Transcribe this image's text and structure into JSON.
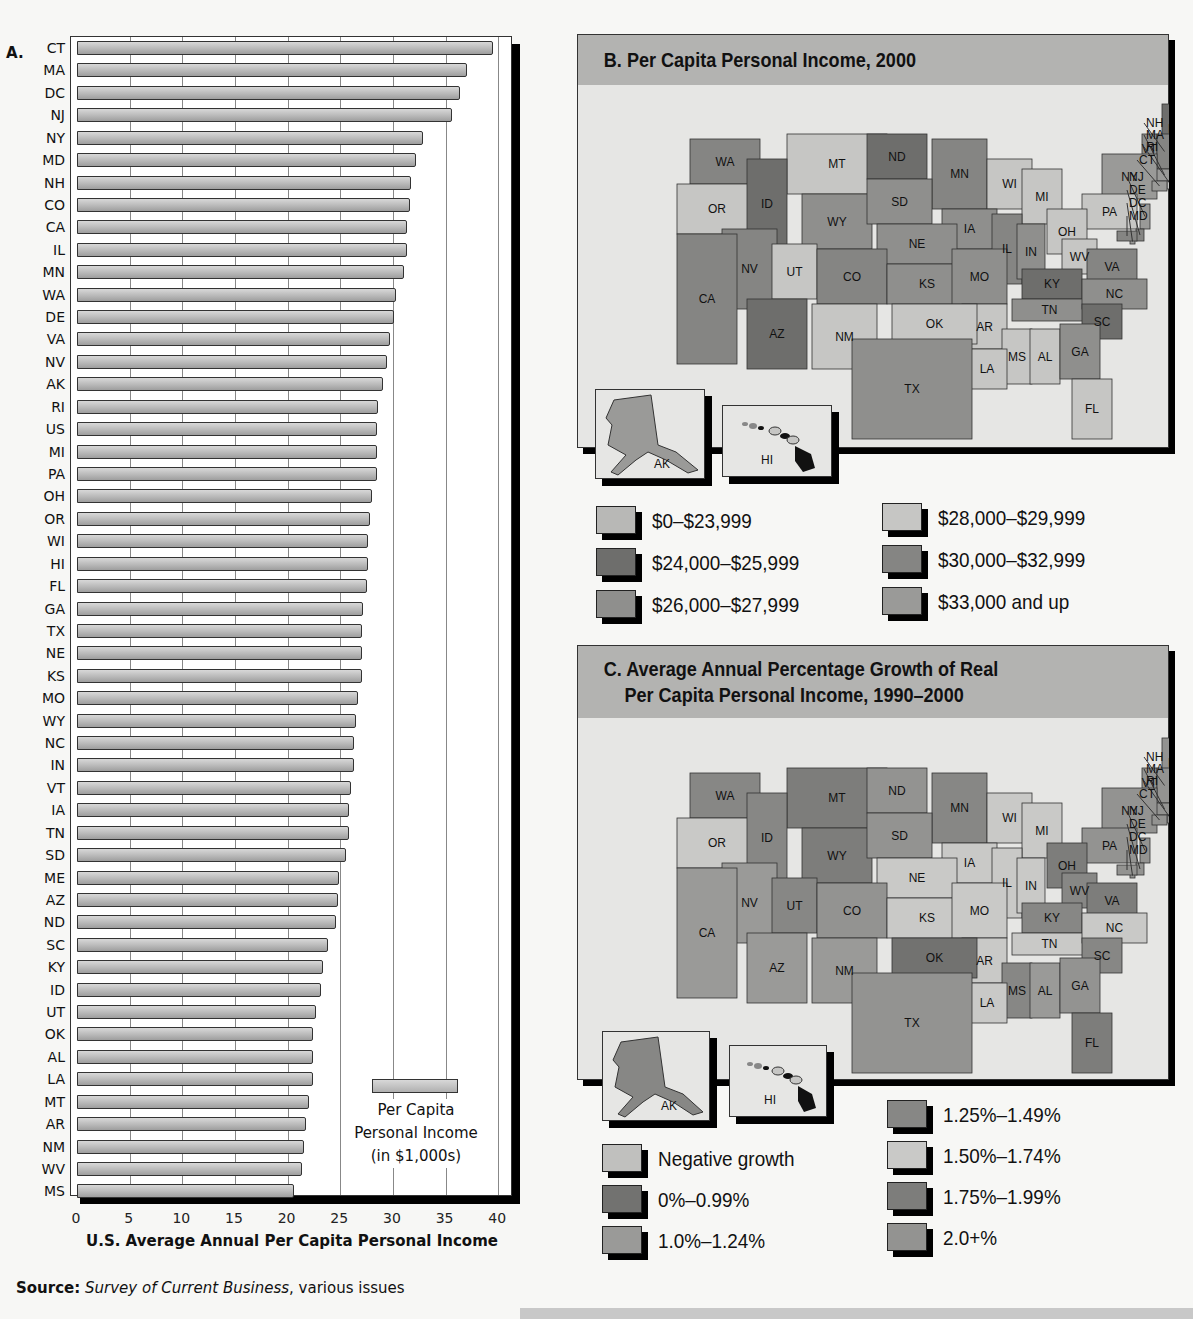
{
  "chart_data": [
    {
      "type": "bar",
      "orientation": "horizontal",
      "panel_label": "A.",
      "title": "",
      "xlabel": "U.S. Average Annual Per Capita Personal Income",
      "ylabel": "",
      "xlim": [
        0,
        40
      ],
      "x_ticks": [
        "0",
        "5",
        "10",
        "15",
        "20",
        "25",
        "30",
        "35",
        "40"
      ],
      "grid": true,
      "legend": {
        "entries": [
          "Per Capita Personal Income (in $1,000s)"
        ],
        "position": "lower right"
      },
      "categories": [
        "CT",
        "MA",
        "DC",
        "NJ",
        "NY",
        "MD",
        "NH",
        "CO",
        "CA",
        "IL",
        "MN",
        "WA",
        "DE",
        "VA",
        "NV",
        "AK",
        "RI",
        "US",
        "MI",
        "PA",
        "OH",
        "OR",
        "WI",
        "HI",
        "FL",
        "GA",
        "TX",
        "NE",
        "KS",
        "MO",
        "WY",
        "NC",
        "IN",
        "VT",
        "IA",
        "TN",
        "SD",
        "ME",
        "AZ",
        "ND",
        "SC",
        "KY",
        "ID",
        "UT",
        "OK",
        "AL",
        "LA",
        "MT",
        "AR",
        "NM",
        "WV",
        "MS"
      ],
      "values": [
        39.5,
        37.0,
        36.4,
        35.6,
        32.9,
        32.2,
        31.7,
        31.6,
        31.3,
        31.3,
        31.1,
        30.3,
        30.1,
        29.7,
        29.4,
        29.1,
        28.6,
        28.5,
        28.5,
        28.5,
        28.0,
        27.8,
        27.6,
        27.6,
        27.5,
        27.2,
        27.1,
        27.1,
        27.1,
        26.7,
        26.5,
        26.3,
        26.3,
        26.0,
        25.8,
        25.8,
        25.5,
        24.9,
        24.8,
        24.6,
        23.8,
        23.4,
        23.2,
        22.7,
        22.4,
        22.4,
        22.4,
        22.0,
        21.7,
        21.6,
        21.4,
        20.6
      ],
      "units": "$1,000s"
    },
    {
      "type": "choropleth",
      "panel_label": "B.",
      "title": "B. Per Capita Personal Income, 2000",
      "legend": [
        {
          "label": "$0–$23,999",
          "color": "#b8b8b6"
        },
        {
          "label": "$24,000–$25,999",
          "color": "#6e6e6c"
        },
        {
          "label": "$26,000–$27,999",
          "color": "#8f8f8d"
        },
        {
          "label": "$28,000–$29,999",
          "color": "#c6c6c4"
        },
        {
          "label": "$30,000–$32,999",
          "color": "#858583"
        },
        {
          "label": "$33,000 and up",
          "color": "#9a9a98"
        }
      ],
      "state_labels": [
        "WA",
        "MT",
        "ND",
        "MN",
        "OR",
        "ID",
        "WY",
        "SD",
        "WI",
        "MI",
        "VT",
        "ME",
        "NH",
        "MA",
        "NY",
        "RI",
        "CT",
        "PA",
        "NJ",
        "DE",
        "DC",
        "MD",
        "IA",
        "NE",
        "IL",
        "IN",
        "OH",
        "WV",
        "VA",
        "KY",
        "NV",
        "UT",
        "CO",
        "KS",
        "MO",
        "CA",
        "TN",
        "NC",
        "SC",
        "AR",
        "OK",
        "AZ",
        "NM",
        "MS",
        "AL",
        "GA",
        "LA",
        "TX",
        "FL",
        "AK",
        "HI"
      ]
    },
    {
      "type": "choropleth",
      "panel_label": "C.",
      "title": "C. Average Annual Percentage Growth of Real Per Capita Personal Income, 1990–2000",
      "legend": [
        {
          "label": "Negative growth",
          "color": "#c0c0be"
        },
        {
          "label": "0%–0.99%",
          "color": "#727270"
        },
        {
          "label": "1.0%–1.24%",
          "color": "#9a9a98"
        },
        {
          "label": "1.25%–1.49%",
          "color": "#878785"
        },
        {
          "label": "1.50%–1.74%",
          "color": "#c9c9c7"
        },
        {
          "label": "1.75%–1.99%",
          "color": "#7d7d7b"
        },
        {
          "label": "2.0+%",
          "color": "#939391"
        }
      ],
      "state_labels": [
        "WA",
        "MT",
        "ND",
        "MN",
        "OR",
        "ID",
        "WY",
        "SD",
        "WI",
        "MI",
        "VT",
        "ME",
        "NH",
        "MA",
        "NY",
        "RI",
        "CT",
        "PA",
        "NJ",
        "DE",
        "DC",
        "MD",
        "IA",
        "NE",
        "IL",
        "IN",
        "OH",
        "WV",
        "VA",
        "KY",
        "NV",
        "UT",
        "CO",
        "KS",
        "MO",
        "CA",
        "TN",
        "NC",
        "SC",
        "AR",
        "OK",
        "AZ",
        "NM",
        "MS",
        "AL",
        "GA",
        "LA",
        "TX",
        "FL",
        "AK",
        "HI"
      ]
    }
  ],
  "panel_a": {
    "label": "A.",
    "xlabel": "U.S. Average Annual Per Capita Personal Income",
    "legend_line1": "Per Capita",
    "legend_line2": "Personal Income",
    "legend_line3": "(in $1,000s)"
  },
  "source": {
    "prefix": "Source:",
    "title": "Survey of Current Business",
    "suffix": ", various issues"
  },
  "panel_b": {
    "title": "B. Per Capita Personal Income, 2000",
    "legend": [
      "$0–$23,999",
      "$24,000–$25,999",
      "$26,000–$27,999",
      "$28,000–$29,999",
      "$30,000–$32,999",
      "$33,000 and up"
    ],
    "inset_ak": "AK",
    "inset_hi": "HI"
  },
  "panel_c": {
    "title_line1": "C. Average Annual Percentage Growth of Real",
    "title_line2": "Per Capita Personal Income, 1990–2000",
    "legend": [
      "Negative growth",
      "0%–0.99%",
      "1.0%–1.24%",
      "1.25%–1.49%",
      "1.50%–1.74%",
      "1.75%–1.99%",
      "2.0+%"
    ],
    "inset_ak": "AK",
    "inset_hi": "HI"
  },
  "colors": {
    "header": "#b3b3b1",
    "panel_bg": "#e6e6e4",
    "bar_fill": "#bdbdbd"
  }
}
